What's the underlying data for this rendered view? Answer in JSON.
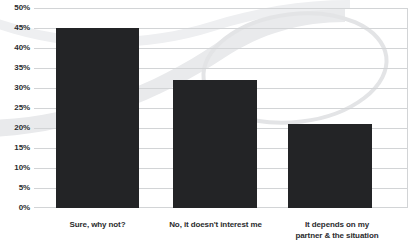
{
  "chart_data": {
    "type": "bar",
    "title": "",
    "subtitle": "",
    "xlabel": "",
    "ylabel": "",
    "categories": [
      "Sure, why not?",
      "No, it doesn't interest me",
      "It depends on my partner & the situation"
    ],
    "category_lines": [
      [
        "Sure, why not?"
      ],
      [
        "No, it doesn't interest me"
      ],
      [
        "It depends on my",
        "partner & the situation"
      ]
    ],
    "values": [
      45,
      32,
      21
    ],
    "ylim": [
      0,
      50
    ],
    "ytick_values": [
      50,
      45,
      40,
      35,
      30,
      25,
      20,
      15,
      10,
      5,
      0
    ],
    "ytick_labels": [
      "50%",
      "45%",
      "40%",
      "35%",
      "30%",
      "25%",
      "20%",
      "15%",
      "10%",
      "5%",
      "0%"
    ],
    "grid": true,
    "legend": "none",
    "bar_color": "#232426",
    "gridline_color": "#d2d4d6",
    "background_color": "#ffffff",
    "watermark_color": "#e7e8ea"
  }
}
